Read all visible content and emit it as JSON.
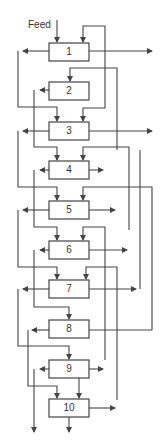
{
  "diagram": {
    "type": "cascade-flowsheet",
    "feed_label": "Feed",
    "stages": [
      {
        "id": 1,
        "label": "1"
      },
      {
        "id": 2,
        "label": "2"
      },
      {
        "id": 3,
        "label": "3"
      },
      {
        "id": 4,
        "label": "4"
      },
      {
        "id": 5,
        "label": "5"
      },
      {
        "id": 6,
        "label": "6"
      },
      {
        "id": 7,
        "label": "7"
      },
      {
        "id": 8,
        "label": "8"
      },
      {
        "id": 9,
        "label": "9"
      },
      {
        "id": 10,
        "label": "10"
      }
    ],
    "colors": {
      "line": "#444444",
      "box_fill": "#ffffff",
      "text": "#333333"
    }
  }
}
